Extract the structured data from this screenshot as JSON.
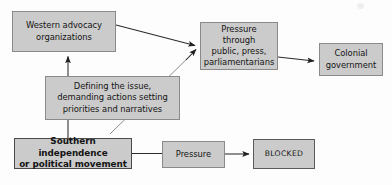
{
  "diagram": {
    "style": {
      "node_fill": "#cbcbcb",
      "node_border": "#8a8a8a",
      "emphasis_border": "#4a4a4a",
      "edge_color": "#2b2b2b",
      "background": "#fdfdfd"
    },
    "nodes": [
      {
        "id": "western-advocacy",
        "label": "Western advocacy\norganizations",
        "x": 12,
        "y": 11,
        "w": 104,
        "h": 41,
        "emphasis": "normal"
      },
      {
        "id": "defining-issue",
        "label": "Defining the issue,\ndemanding actions setting\npriorities and narratives",
        "x": 45,
        "y": 76,
        "w": 135,
        "h": 44,
        "emphasis": "normal"
      },
      {
        "id": "southern-independence",
        "label": "Southern independence\nor political movement",
        "x": 14,
        "y": 138,
        "w": 118,
        "h": 31,
        "emphasis": "strong"
      },
      {
        "id": "pressure-through",
        "label": "Pressure through\npublic, press,\nparliamentarians",
        "x": 200,
        "y": 22,
        "w": 78,
        "h": 48,
        "emphasis": "normal"
      },
      {
        "id": "colonial-government",
        "label": "Colonial\ngovernment",
        "x": 319,
        "y": 43,
        "w": 64,
        "h": 33,
        "emphasis": "normal"
      },
      {
        "id": "pressure",
        "label": "Pressure",
        "x": 162,
        "y": 141,
        "w": 63,
        "h": 27,
        "emphasis": "normal"
      },
      {
        "id": "blocked",
        "label": "BLOCKED",
        "x": 253,
        "y": 139,
        "w": 62,
        "h": 30,
        "emphasis": "blocked"
      }
    ],
    "edges": [
      {
        "id": "defining-to-western",
        "from": "defining-issue",
        "to": "western-advocacy",
        "arrow": true
      },
      {
        "id": "western-to-pressure-through",
        "from": "western-advocacy",
        "to": "pressure-through",
        "arrow": true
      },
      {
        "id": "southern-to-pressure-through",
        "from": "southern-independence",
        "to": "pressure-through",
        "arrow": true
      },
      {
        "id": "pressure-through-to-colonial",
        "from": "pressure-through",
        "to": "colonial-government",
        "arrow": true
      },
      {
        "id": "southern-to-defining",
        "from": "southern-independence",
        "to": "defining-issue",
        "arrow": false
      },
      {
        "id": "southern-to-pressure",
        "from": "southern-independence",
        "to": "pressure",
        "arrow": false
      },
      {
        "id": "pressure-to-blocked",
        "from": "pressure",
        "to": "blocked",
        "arrow": true
      }
    ]
  }
}
